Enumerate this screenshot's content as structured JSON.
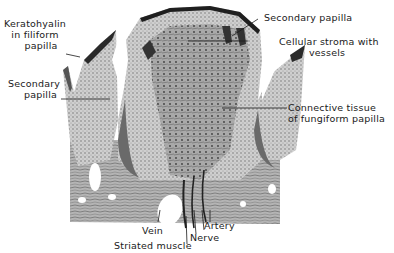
{
  "figure": {
    "labels": {
      "keratohyalin": [
        "Keratohyalin",
        "in filiform",
        "papilla"
      ],
      "secondary_papilla_left": [
        "Secondary",
        "papilla"
      ],
      "secondary_papilla_top": "Secondary papilla",
      "cellular_stroma": [
        "Cellular stroma with",
        "vessels"
      ],
      "connective_tissue": [
        "Connective tissue",
        "of fungiform papilla"
      ],
      "artery": "Artery",
      "nerve": "Nerve",
      "vein": "Vein",
      "striated_muscle": "Striated muscle"
    }
  }
}
